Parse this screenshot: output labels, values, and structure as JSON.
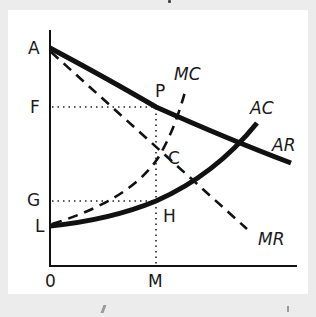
{
  "diagram": {
    "title": "",
    "axes": {
      "origin_label": "0",
      "x_label": "M",
      "y_labels": [
        "A",
        "F",
        "G",
        "L"
      ]
    },
    "curves": [
      {
        "id": "AR",
        "label": "AR",
        "style": "solid-thick"
      },
      {
        "id": "MR",
        "label": "MR",
        "style": "dashed"
      },
      {
        "id": "AC",
        "label": "AC",
        "style": "solid-thick"
      },
      {
        "id": "MC",
        "label": "MC",
        "style": "dashed"
      }
    ],
    "points": {
      "P": "P",
      "C": "C",
      "H": "H"
    },
    "labels": {
      "A": "A",
      "F": "F",
      "G": "G",
      "L": "L",
      "O": "0",
      "M": "M",
      "P": "P",
      "C": "C",
      "H": "H",
      "MC": "MC",
      "AC": "AC",
      "AR": "AR",
      "MR": "MR"
    },
    "colors": {
      "background": "#ececec",
      "panel": "#ffffff",
      "ink": "#111111"
    }
  }
}
